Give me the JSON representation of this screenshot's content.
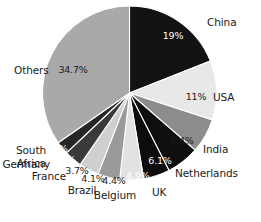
{
  "chart_data": {
    "type": "pie",
    "title": "",
    "subtitle": "",
    "xlabel": "",
    "ylabel": "",
    "legend_position": "callout-labels",
    "grid": false,
    "units": "percent",
    "start_angle_deg": 0,
    "direction": "clockwise",
    "categories": [
      "China",
      "USA",
      "India",
      "Netherlands",
      "UK",
      "Belgium",
      "Brazil",
      "France",
      "Germany",
      "South Africa",
      "Others"
    ],
    "values": [
      19,
      11,
      6.4,
      6.1,
      4.9,
      4.4,
      4.1,
      3.7,
      3.3,
      2.4,
      34.7
    ],
    "value_labels": [
      "19%",
      "11%",
      "6.4%",
      "6.1%",
      "4.9%",
      "4.4%",
      "4.1%",
      "3.7%",
      "3.3%",
      "2.4%",
      "34.7%"
    ],
    "colors": [
      "#121212",
      "#e8e8e8",
      "#8c8c8c",
      "#0f0f0f",
      "#0d0d0d",
      "#e2e2e2",
      "#9a9a9a",
      "#cfcfcf",
      "#3a3a3a",
      "#262626",
      "#a9a9a9"
    ],
    "label_text_colors": [
      "#ffffff",
      "#1b1b1b",
      "#1b1b1b",
      "#ffffff",
      "#ffffff",
      "#1b1b1b",
      "#1b1b1b",
      "#1b1b1b",
      "#ffffff",
      "#ffffff",
      "#1b1b1b"
    ]
  },
  "labels": {
    "china": "China",
    "usa": "USA",
    "india": "India",
    "netherlands": "Netherlands",
    "uk": "UK",
    "belgium": "Belgium",
    "brazil": "Brazil",
    "france": "France",
    "germany": "Germany",
    "south": "South",
    "africa": "Africa",
    "others": "Others"
  },
  "percents": {
    "china": "19%",
    "usa": "11%",
    "india": "6.4%",
    "netherlands": "6.1%",
    "uk": "4.9%",
    "belgium": "4.4%",
    "brazil": "4.1%",
    "france": "3.7%",
    "germany": "3.3%",
    "south_africa": "2.4%",
    "others": "34.7%"
  }
}
